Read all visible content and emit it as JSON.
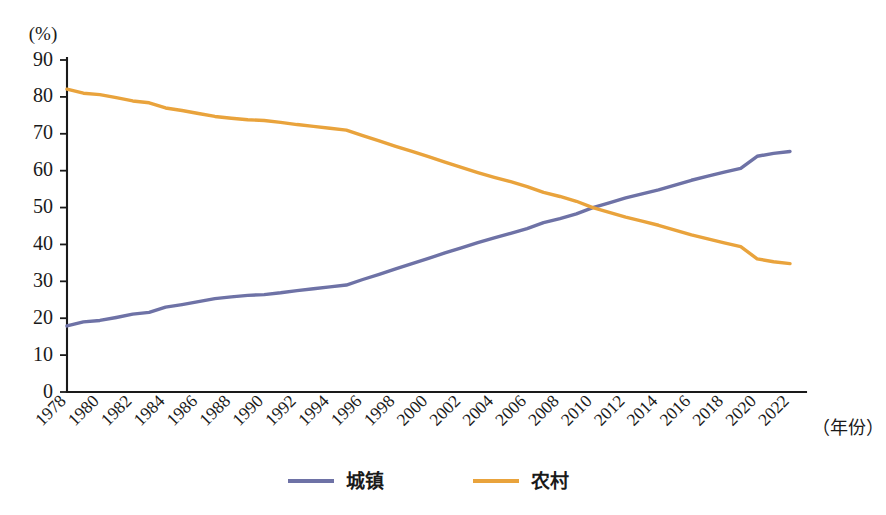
{
  "chart_data": {
    "type": "line",
    "title": "",
    "xlabel": "（年份）",
    "ylabel": "(%)",
    "ylim": [
      0,
      90
    ],
    "grid": false,
    "legend_position": "bottom-center",
    "x": [
      1978,
      1979,
      1980,
      1981,
      1982,
      1983,
      1984,
      1985,
      1986,
      1987,
      1988,
      1989,
      1990,
      1991,
      1992,
      1993,
      1994,
      1995,
      1996,
      1997,
      1998,
      1999,
      2000,
      2001,
      2002,
      2003,
      2004,
      2005,
      2006,
      2007,
      2008,
      2009,
      2010,
      2011,
      2012,
      2013,
      2014,
      2015,
      2016,
      2017,
      2018,
      2019,
      2020,
      2021,
      2022
    ],
    "xtick_labels": [
      "1978",
      "1980",
      "1982",
      "1984",
      "1986",
      "1988",
      "1990",
      "1992",
      "1994",
      "1996",
      "1998",
      "2000",
      "2002",
      "2004",
      "2006",
      "2008",
      "2010",
      "2012",
      "2014",
      "2016",
      "2018",
      "2020",
      "2022"
    ],
    "ytick_labels": [
      "0",
      "10",
      "20",
      "30",
      "40",
      "50",
      "60",
      "70",
      "80",
      "90"
    ],
    "ytick_values": [
      0,
      10,
      20,
      30,
      40,
      50,
      60,
      70,
      80,
      90
    ],
    "series": [
      {
        "name": "城镇",
        "color": "#6E72A6",
        "values": [
          17.9,
          19.0,
          19.4,
          20.2,
          21.1,
          21.6,
          23.0,
          23.7,
          24.5,
          25.3,
          25.8,
          26.2,
          26.4,
          26.9,
          27.5,
          28.0,
          28.5,
          29.0,
          30.5,
          31.9,
          33.4,
          34.8,
          36.2,
          37.7,
          39.1,
          40.5,
          41.8,
          43.0,
          44.3,
          45.9,
          47.0,
          48.3,
          50.0,
          51.3,
          52.6,
          53.7,
          54.8,
          56.1,
          57.4,
          58.5,
          59.6,
          60.6,
          63.9,
          64.7,
          65.2
        ]
      },
      {
        "name": "农村",
        "color": "#E9A33C",
        "values": [
          82.1,
          81.0,
          80.6,
          79.8,
          78.9,
          78.4,
          77.0,
          76.3,
          75.5,
          74.7,
          74.2,
          73.8,
          73.6,
          73.1,
          72.5,
          72.0,
          71.5,
          71.0,
          69.5,
          68.1,
          66.6,
          65.2,
          63.8,
          62.3,
          60.9,
          59.5,
          58.2,
          57.0,
          55.7,
          54.1,
          53.0,
          51.7,
          50.0,
          48.7,
          47.4,
          46.3,
          45.2,
          43.9,
          42.6,
          41.5,
          40.4,
          39.4,
          36.1,
          35.3,
          34.8
        ]
      }
    ],
    "crossover": {
      "year": 2011,
      "value": 50.5
    }
  },
  "legend": {
    "items": [
      {
        "label": "城镇",
        "color": "#6E72A6"
      },
      {
        "label": "农村",
        "color": "#E9A33C"
      }
    ]
  },
  "axes": {
    "y_unit": "(%)",
    "x_title": "（年份）"
  }
}
